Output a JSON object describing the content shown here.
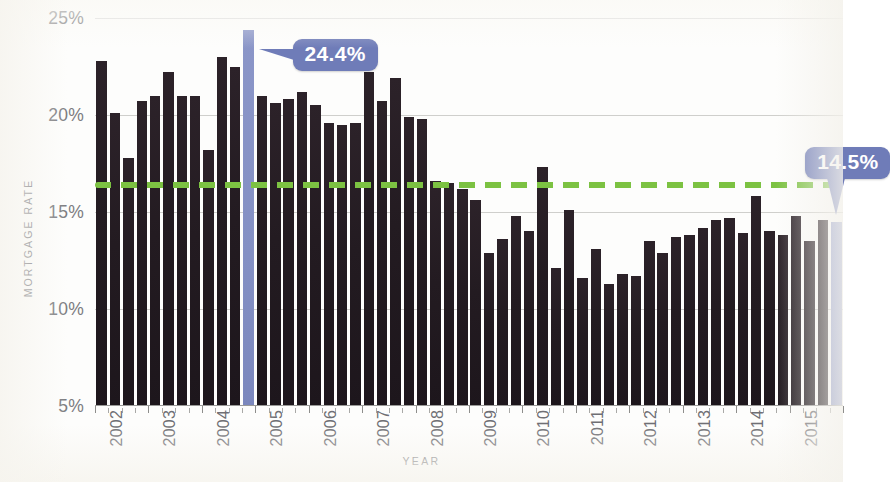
{
  "chart_data": {
    "type": "bar",
    "title": "",
    "subtitle": "",
    "xlabel": "YEAR",
    "ylabel": "MORTGAGE RATE",
    "ylim": [
      5,
      25
    ],
    "ytick_labels": [
      "25%",
      "20%",
      "15%",
      "10%",
      "5%"
    ],
    "ytick_values": [
      25,
      20,
      15,
      10,
      5
    ],
    "ytick_suffix": "%",
    "grid": "horizontal",
    "legend": "none",
    "x_tick_labels": [
      "2002",
      "2003",
      "2004",
      "2005",
      "2006",
      "2007",
      "2008",
      "2009",
      "2010",
      "2011",
      "2012",
      "2013",
      "2014",
      "2015"
    ],
    "x_period": "quarterly",
    "categories": [
      "2002 Q1",
      "2002 Q2",
      "2002 Q3",
      "2002 Q4",
      "2003 Q1",
      "2003 Q2",
      "2003 Q3",
      "2003 Q4",
      "2004 Q1",
      "2004 Q2",
      "2004 Q3",
      "2004 Q4",
      "2005 Q1",
      "2005 Q2",
      "2005 Q3",
      "2005 Q4",
      "2006 Q1",
      "2006 Q2",
      "2006 Q3",
      "2006 Q4",
      "2007 Q1",
      "2007 Q2",
      "2007 Q3",
      "2007 Q4",
      "2008 Q1",
      "2008 Q2",
      "2008 Q3",
      "2008 Q4",
      "2009 Q1",
      "2009 Q2",
      "2009 Q3",
      "2009 Q4",
      "2010 Q1",
      "2010 Q2",
      "2010 Q3",
      "2010 Q4",
      "2011 Q1",
      "2011 Q2",
      "2011 Q3",
      "2011 Q4",
      "2012 Q1",
      "2012 Q2",
      "2012 Q3",
      "2012 Q4",
      "2013 Q1",
      "2013 Q2",
      "2013 Q3",
      "2013 Q4",
      "2014 Q1",
      "2014 Q2",
      "2014 Q3",
      "2014 Q4",
      "2015 Q1",
      "2015 Q2",
      "2015 Q3",
      "2015 Q4"
    ],
    "values": [
      22.8,
      20.1,
      17.8,
      20.7,
      21.0,
      22.2,
      21.0,
      21.0,
      18.2,
      23.0,
      22.5,
      24.4,
      21.0,
      20.6,
      20.8,
      21.2,
      20.5,
      19.6,
      19.5,
      19.6,
      22.2,
      20.7,
      21.9,
      19.9,
      19.8,
      16.6,
      16.5,
      16.2,
      15.6,
      12.9,
      13.6,
      14.8,
      14.0,
      17.3,
      12.1,
      15.1,
      11.6,
      13.1,
      11.3,
      11.8,
      11.7,
      13.5,
      12.9,
      13.7,
      13.8,
      14.2,
      14.6,
      14.7,
      13.9,
      15.8,
      14.0,
      13.8,
      14.8,
      13.5,
      14.6,
      14.5
    ],
    "highlighted": [
      {
        "index": 11,
        "label": "24.4%",
        "value": 24.4,
        "color": "#6f7cb8"
      },
      {
        "index": 55,
        "label": "14.5%",
        "value": 14.5,
        "color": "#6f7cb8"
      }
    ],
    "average_line": {
      "value": 16.4,
      "style": "dashed",
      "color": "#7cc242"
    },
    "colors": {
      "bar": "#241c22",
      "highlight_bar": "#8490c4",
      "callout": "#6f7cb8",
      "average_line": "#7cc242",
      "gridline": "#cfcfcc",
      "axis_text": "#6f7cb8"
    }
  },
  "annotations": {
    "peak": {
      "label": "24.4%"
    },
    "latest": {
      "label": "14.5%"
    }
  }
}
